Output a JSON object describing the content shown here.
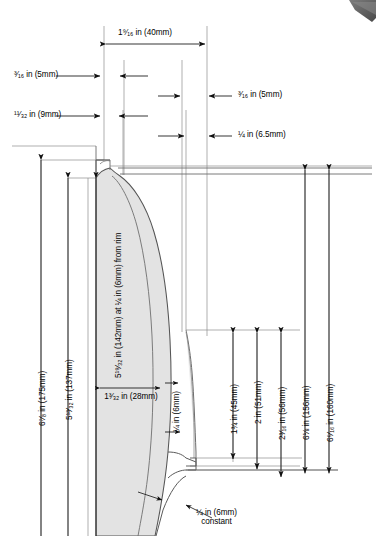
{
  "drawing": {
    "title": "Bowl cross-section dimension drawing",
    "type": "technical-cross-section",
    "units": "imperial fractions with metric in parentheses",
    "colors": {
      "line": "#6e6e6e",
      "outline": "#555555",
      "fill": "#e3e3e3",
      "fill_inner": "#ededed",
      "text": "#000000",
      "corner_wedge": "#5a5a5a"
    }
  },
  "labels": {
    "top_width": "1⁹⁄₁₆ in (40mm)",
    "left_rim_thickness": "³⁄₁₆ in (5mm)",
    "left_wall_thickness": "¹¹⁄₃₂ in (9mm)",
    "right_upper_thickness": "³⁄₁₆ in (5mm)",
    "right_lower_thickness": "¼ in (6.5mm)",
    "height_outer": "6⁷⁄₈ in (175mm)",
    "height_inner": "5¹³⁄₃₂ in (137mm)",
    "bowl_diameter": "5¹⁹⁄₃₂ in (142mm) at ¼ in (6mm) from rim",
    "foot_width": "1³⁄₃₂ in (28mm)",
    "foot_thickness": "¼ in (6mm)",
    "dim_45": "1¾ in (45mm)",
    "dim_51": "2 in (51mm)",
    "dim_56": "2³⁄₁₆ in (56mm)",
    "dim_156": "6⅛ in (156mm)",
    "dim_160": "6⁵⁄₁₆ in (160mm)",
    "constant_note_line1": "¼ in (6mm)",
    "constant_note_line2": "constant"
  }
}
